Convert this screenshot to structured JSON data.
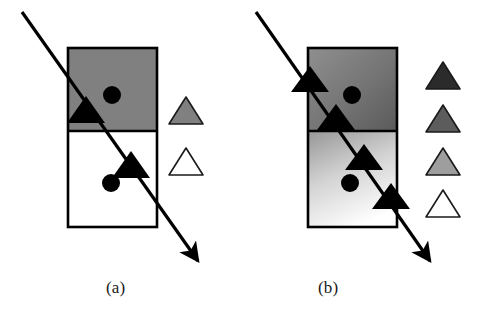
{
  "figure": {
    "background_color": "#ffffff",
    "ink_color": "#000000",
    "panels": [
      {
        "id": "a",
        "caption": "(a)",
        "caption_x": 106,
        "caption_y": 278,
        "box": {
          "x": 68,
          "y": 48,
          "width": 89,
          "height": 179,
          "divider_y": 131,
          "stroke": "#000000",
          "stroke_width": 2.5
        },
        "cells": [
          {
            "name": "upper-cell",
            "fill_type": "solid",
            "fill": "#808080",
            "label": "uniform gray region"
          },
          {
            "name": "lower-cell",
            "fill_type": "solid",
            "fill": "#ffffff",
            "label": "uniform white region"
          }
        ],
        "circles": [
          {
            "cx": 112,
            "cy": 95,
            "r": 9,
            "fill": "#000000"
          },
          {
            "cx": 111,
            "cy": 183,
            "r": 9,
            "fill": "#000000"
          }
        ],
        "arrow": {
          "x1": 22,
          "y1": 12,
          "x2": 205,
          "y2": 271,
          "stroke_width": 3.2,
          "head_length": 19,
          "head_width": 13
        },
        "markers": [
          {
            "cx": 86,
            "cy": 110,
            "size": 19,
            "fill": "#000000"
          },
          {
            "cx": 131,
            "cy": 165,
            "size": 19,
            "fill": "#000000"
          }
        ],
        "legend": {
          "x": 186,
          "items": [
            {
              "label": "gray-triangle",
              "fill": "#808080",
              "stroke": "#1a1a1a",
              "cy": 110,
              "size": 15
            },
            {
              "label": "white-triangle",
              "fill": "#ffffff",
              "stroke": "#1a1a1a",
              "cy": 161,
              "size": 15
            }
          ]
        }
      },
      {
        "id": "b",
        "caption": "(b)",
        "caption_x": 318,
        "caption_y": 278,
        "box": {
          "x": 308,
          "y": 48,
          "width": 89,
          "height": 179,
          "divider_y": 131,
          "stroke": "#000000",
          "stroke_width": 2.5
        },
        "cells": [
          {
            "name": "upper-cell",
            "fill_type": "gradient",
            "fill_from": "#8c8c8c",
            "fill_to": "#5e5e5e",
            "label": "graded dark gray region"
          },
          {
            "name": "lower-cell",
            "fill_type": "gradient",
            "fill_from": "#9a9a9a",
            "fill_to": "#ffffff",
            "label": "graded light gray to white region"
          }
        ],
        "circles": [
          {
            "cx": 352,
            "cy": 95,
            "r": 9,
            "fill": "#000000"
          },
          {
            "cx": 350,
            "cy": 183,
            "r": 9,
            "fill": "#000000"
          }
        ],
        "arrow": {
          "x1": 256,
          "y1": 12,
          "x2": 437,
          "y2": 271,
          "stroke_width": 3.2,
          "head_length": 19,
          "head_width": 13
        },
        "markers": [
          {
            "cx": 310,
            "cy": 79,
            "size": 19,
            "fill": "#000000"
          },
          {
            "cx": 336,
            "cy": 117,
            "size": 19,
            "fill": "#000000"
          },
          {
            "cx": 364,
            "cy": 157,
            "size": 19,
            "fill": "#000000"
          },
          {
            "cx": 391,
            "cy": 196,
            "size": 19,
            "fill": "#000000"
          }
        ],
        "legend": {
          "x": 443,
          "items": [
            {
              "label": "darkest-triangle",
              "fill": "#2b2b2b",
              "stroke": "#1a1a1a",
              "cy": 75,
              "size": 15
            },
            {
              "label": "dark-gray-triangle",
              "fill": "#5c5c5c",
              "stroke": "#1a1a1a",
              "cy": 118,
              "size": 15
            },
            {
              "label": "light-gray-triangle",
              "fill": "#9e9e9e",
              "stroke": "#1a1a1a",
              "cy": 161,
              "size": 15
            },
            {
              "label": "white-triangle",
              "fill": "#ffffff",
              "stroke": "#1a1a1a",
              "cy": 203,
              "size": 15
            }
          ]
        }
      }
    ]
  }
}
